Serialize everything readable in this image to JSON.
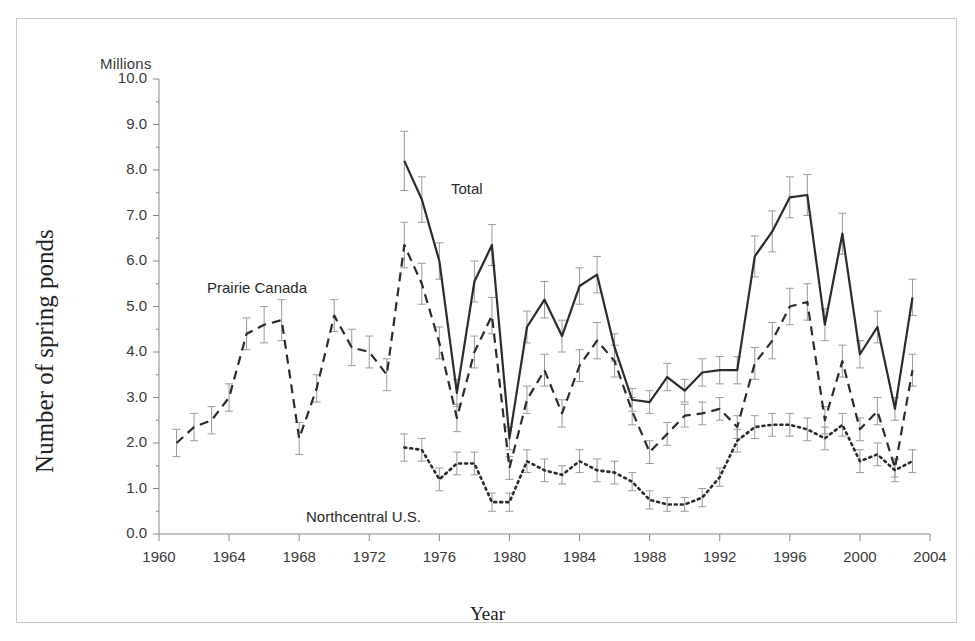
{
  "figure": {
    "unit_label": "Millions",
    "y_title": "Number of spring ponds",
    "x_title": "Year"
  },
  "annotations": [
    {
      "name": "series-label-total",
      "text": "Total",
      "x": 434,
      "y": 161
    },
    {
      "name": "series-label-prairie-canada",
      "text": "Prairie Canada",
      "x": 190,
      "y": 260
    },
    {
      "name": "series-label-northcentral-us",
      "text": "Northcentral U.S.",
      "x": 289,
      "y": 489
    }
  ],
  "chart_data": {
    "type": "line",
    "title": "",
    "xlabel": "Year",
    "ylabel": "Number of spring ponds",
    "unit": "Millions",
    "xlim": [
      1960,
      2004
    ],
    "ylim": [
      0.0,
      10.0
    ],
    "y_tick_step": 1.0,
    "y_minor_ticks": true,
    "x_tick_step": 4,
    "grid": false,
    "legend": "inline-annotations",
    "error_bars": true,
    "x_ticks": [
      1960,
      1964,
      1968,
      1972,
      1976,
      1980,
      1984,
      1988,
      1992,
      1996,
      2000,
      2004
    ],
    "y_ticks": [
      "0.0",
      "1.0",
      "2.0",
      "3.0",
      "4.0",
      "5.0",
      "6.0",
      "7.0",
      "8.0",
      "9.0",
      "10.0"
    ],
    "series": [
      {
        "name": "Total",
        "style": "solid",
        "x": [
          1974,
          1975,
          1976,
          1977,
          1978,
          1979,
          1980,
          1981,
          1982,
          1983,
          1984,
          1985,
          1986,
          1987,
          1988,
          1989,
          1990,
          1991,
          1992,
          1993,
          1994,
          1995,
          1996,
          1997,
          1998,
          1999,
          2000,
          2001,
          2002,
          2003
        ],
        "values": [
          8.2,
          7.35,
          6.0,
          3.1,
          5.55,
          6.35,
          2.1,
          4.55,
          5.15,
          4.35,
          5.45,
          5.7,
          4.1,
          2.95,
          2.9,
          3.45,
          3.15,
          3.55,
          3.6,
          3.6,
          6.1,
          6.65,
          7.4,
          7.45,
          4.6,
          6.6,
          3.95,
          4.55,
          2.75,
          5.2
        ],
        "err_low": [
          7.55,
          6.85,
          5.6,
          2.8,
          5.1,
          5.9,
          1.85,
          4.2,
          4.75,
          4.0,
          5.05,
          5.3,
          3.8,
          2.7,
          2.65,
          3.15,
          2.9,
          3.25,
          3.3,
          3.3,
          5.65,
          6.2,
          6.95,
          7.0,
          4.25,
          6.15,
          3.65,
          4.2,
          2.5,
          4.8
        ],
        "err_high": [
          8.85,
          7.85,
          6.4,
          3.4,
          6.0,
          6.8,
          2.35,
          4.9,
          5.55,
          4.7,
          5.85,
          6.1,
          4.4,
          3.2,
          3.15,
          3.75,
          3.4,
          3.85,
          3.9,
          3.9,
          6.55,
          7.1,
          7.85,
          7.9,
          4.95,
          7.05,
          4.25,
          4.9,
          3.0,
          5.6
        ]
      },
      {
        "name": "Prairie Canada",
        "style": "dashed",
        "x": [
          1961,
          1962,
          1963,
          1964,
          1965,
          1966,
          1967,
          1968,
          1969,
          1970,
          1971,
          1972,
          1973,
          1974,
          1975,
          1976,
          1977,
          1978,
          1979,
          1980,
          1981,
          1982,
          1983,
          1984,
          1985,
          1986,
          1987,
          1988,
          1989,
          1990,
          1991,
          1992,
          1993,
          1994,
          1995,
          1996,
          1997,
          1998,
          1999,
          2000,
          2001,
          2002,
          2003
        ],
        "values": [
          2.0,
          2.35,
          2.5,
          3.0,
          4.4,
          4.6,
          4.7,
          2.1,
          3.2,
          4.8,
          4.1,
          4.0,
          3.5,
          6.35,
          5.5,
          4.2,
          2.55,
          4.0,
          4.8,
          1.45,
          2.95,
          3.6,
          2.65,
          3.7,
          4.25,
          3.8,
          2.7,
          1.8,
          2.2,
          2.6,
          2.65,
          2.75,
          2.35,
          3.75,
          4.25,
          5.0,
          5.1,
          2.5,
          3.8,
          2.3,
          2.7,
          1.45,
          3.6
        ],
        "err_low": [
          1.7,
          2.05,
          2.2,
          2.7,
          4.05,
          4.2,
          4.25,
          1.75,
          2.9,
          4.45,
          3.7,
          3.65,
          3.15,
          5.85,
          5.05,
          3.85,
          2.25,
          3.65,
          4.4,
          1.2,
          2.65,
          3.25,
          2.35,
          3.35,
          3.85,
          3.45,
          2.4,
          1.55,
          1.95,
          2.35,
          2.4,
          2.5,
          2.1,
          3.4,
          3.85,
          4.6,
          4.7,
          2.2,
          3.45,
          2.05,
          2.4,
          1.25,
          3.25
        ],
        "err_high": [
          2.3,
          2.65,
          2.8,
          3.3,
          4.75,
          5.0,
          5.15,
          2.45,
          3.5,
          5.15,
          4.5,
          4.35,
          3.85,
          6.85,
          5.95,
          4.55,
          2.85,
          4.35,
          5.2,
          1.7,
          3.25,
          3.95,
          2.95,
          4.05,
          4.65,
          4.15,
          3.0,
          2.05,
          2.45,
          2.85,
          2.9,
          3.0,
          2.6,
          4.1,
          4.65,
          5.4,
          5.5,
          2.8,
          4.15,
          2.55,
          3.0,
          1.65,
          3.95
        ]
      },
      {
        "name": "Northcentral U.S.",
        "style": "dotted",
        "x": [
          1974,
          1975,
          1976,
          1977,
          1978,
          1979,
          1980,
          1981,
          1982,
          1983,
          1984,
          1985,
          1986,
          1987,
          1988,
          1989,
          1990,
          1991,
          1992,
          1993,
          1994,
          1995,
          1996,
          1997,
          1998,
          1999,
          2000,
          2001,
          2002,
          2003
        ],
        "values": [
          1.9,
          1.85,
          1.2,
          1.55,
          1.55,
          0.7,
          0.7,
          1.6,
          1.4,
          1.3,
          1.6,
          1.4,
          1.35,
          1.15,
          0.75,
          0.65,
          0.65,
          0.8,
          1.25,
          2.05,
          2.35,
          2.4,
          2.4,
          2.3,
          2.1,
          2.4,
          1.6,
          1.75,
          1.4,
          1.6
        ],
        "err_low": [
          1.6,
          1.6,
          0.95,
          1.3,
          1.3,
          0.5,
          0.5,
          1.35,
          1.15,
          1.1,
          1.35,
          1.15,
          1.1,
          0.95,
          0.55,
          0.5,
          0.5,
          0.6,
          1.05,
          1.8,
          2.1,
          2.15,
          2.15,
          2.05,
          1.85,
          2.15,
          1.35,
          1.5,
          1.15,
          1.35
        ],
        "err_high": [
          2.2,
          2.1,
          1.45,
          1.8,
          1.8,
          0.9,
          0.9,
          1.85,
          1.65,
          1.5,
          1.85,
          1.65,
          1.6,
          1.35,
          0.95,
          0.8,
          0.8,
          1.0,
          1.45,
          2.3,
          2.6,
          2.65,
          2.65,
          2.55,
          2.35,
          2.65,
          1.85,
          2.0,
          1.65,
          1.85
        ]
      }
    ]
  },
  "colors": {
    "line": "#2b2b2b",
    "error_bar": "#9a9a9a",
    "axis": "#8a8a8a",
    "text": "#333333",
    "frame": "#c8c8c8",
    "background": "#ffffff"
  }
}
